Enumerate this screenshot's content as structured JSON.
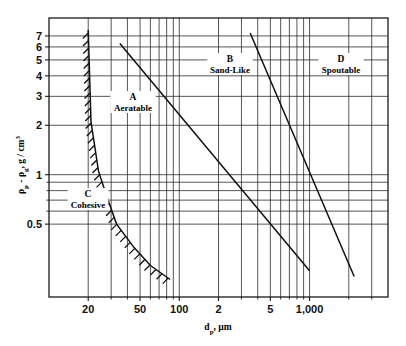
{
  "figure": {
    "title": "",
    "background": "#ffffff",
    "line_color": "#111111",
    "grid_color": "#2b2b2b"
  },
  "chart_data": {
    "type": "line",
    "title": "",
    "subtitle": "",
    "xlabel": "d_p, µm",
    "xlabel_parts": {
      "base": "d",
      "sub": "p",
      "rest": ", µm"
    },
    "ylabel": "ρp - ρg, g / cm³",
    "ylabel_parts": {
      "p1": "ρ",
      "p1sub": "p",
      "dash": " - ",
      "p2": "ρ",
      "p2sub": "g",
      "rest": ", g / cm",
      "sup": "3"
    },
    "xscale": "log",
    "yscale": "log",
    "xlim": [
      10,
      4000
    ],
    "ylim": [
      0.18,
      9
    ],
    "grid": true,
    "legend": "none",
    "xticks": [
      {
        "value": 20,
        "label": "20",
        "major": true
      },
      {
        "value": 50,
        "label": "50",
        "major": true
      },
      {
        "value": 100,
        "label": "100",
        "major": true
      },
      {
        "value": 200,
        "label": "2",
        "major": true
      },
      {
        "value": 500,
        "label": "5",
        "major": true
      },
      {
        "value": 1000,
        "label": "1,000",
        "major": true
      }
    ],
    "xminor": [
      10,
      30,
      40,
      60,
      70,
      80,
      90,
      300,
      400,
      600,
      700,
      800,
      900,
      2000,
      3000,
      4000
    ],
    "yticks": [
      {
        "value": 0.5,
        "label": "0.5"
      },
      {
        "value": 1,
        "label": "1"
      },
      {
        "value": 2,
        "label": "2"
      },
      {
        "value": 3,
        "label": "3"
      },
      {
        "value": 4,
        "label": "4"
      },
      {
        "value": 5,
        "label": "5"
      },
      {
        "value": 6,
        "label": "6"
      },
      {
        "value": 7,
        "label": "7"
      }
    ],
    "yminor": [
      0.6,
      0.7,
      0.8,
      0.9
    ],
    "regions": [
      {
        "id": "A",
        "letter": "A",
        "name": "Aeratable",
        "x": 200,
        "y": 2.3
      },
      {
        "id": "B",
        "letter": "B",
        "name": "Sand-Like",
        "x": 200,
        "y": 4.0
      },
      {
        "id": "C",
        "letter": "C",
        "name": "Cohesive",
        "x": 100,
        "y": 0.55
      },
      {
        "id": "D",
        "letter": "D",
        "name": "Spoutable",
        "x": 200,
        "y": 4.0
      }
    ],
    "series": [
      {
        "name": "A/B boundary",
        "style": "solid",
        "points": [
          [
            35,
            6.3
          ],
          [
            1000,
            0.26
          ]
        ]
      },
      {
        "name": "B/D boundary",
        "style": "solid",
        "points": [
          [
            350,
            7.3
          ],
          [
            2200,
            0.24
          ]
        ]
      },
      {
        "name": "C/A boundary",
        "style": "hatched",
        "points": [
          [
            20,
            7.6
          ],
          [
            21,
            2.1
          ],
          [
            24,
            1.05
          ],
          [
            28,
            0.72
          ],
          [
            33,
            0.5
          ],
          [
            45,
            0.36
          ],
          [
            60,
            0.28
          ],
          [
            85,
            0.23
          ]
        ]
      }
    ]
  },
  "plot_box": {
    "left": 49,
    "top": 18,
    "right": 388,
    "bottom": 297
  }
}
